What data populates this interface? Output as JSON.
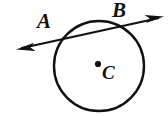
{
  "figure": {
    "kind": "geometry-diagram",
    "background_color": "#FFFFFF",
    "stroke_color": "#111111",
    "labels": {
      "point_a": "A",
      "point_b": "B",
      "center_c": "C"
    },
    "geometry": {
      "circle": {
        "center_x": 99,
        "center_y": 66,
        "radius": 45,
        "stroke_width": 2.4
      },
      "center_dot": {
        "x": 98,
        "y": 64,
        "radius": 3
      },
      "secant_line": {
        "start_x": 17,
        "start_y": 49,
        "end_x": 163,
        "end_y": 17,
        "stroke_width": 2.2,
        "arrowheads": "both",
        "intersection_a_x": 60,
        "intersection_a_y": 40,
        "intersection_b_x": 119,
        "intersection_b_y": 27
      }
    }
  }
}
